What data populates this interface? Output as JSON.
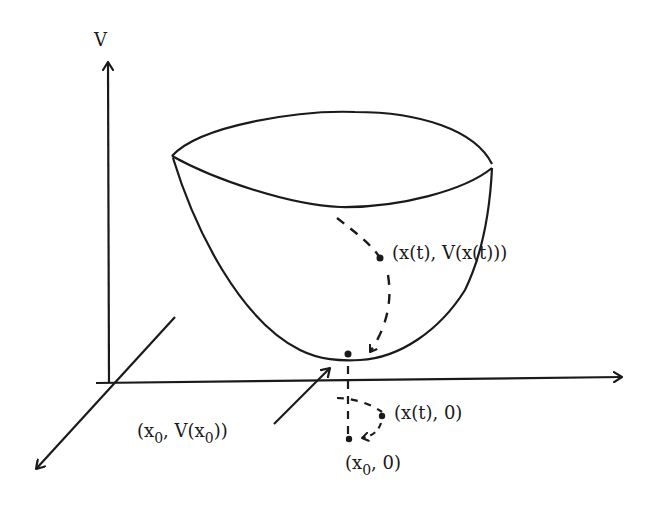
{
  "diagram": {
    "type": "lyapunov-function-bowl",
    "colors": {
      "ink": "#1a1a1a",
      "background": "#ffffff"
    },
    "axes": {
      "vertical_label": "V"
    },
    "labels": {
      "trajectory_on_surface": "(x(t),  V(x(t)))",
      "minimum_point_prefix": "(x",
      "minimum_point_sub1": "0",
      "minimum_point_mid": ", V(x",
      "minimum_point_sub2": "0",
      "minimum_point_suffix": "))",
      "trajectory_in_plane": "(x(t),  0)",
      "equilibrium_prefix": "(x",
      "equilibrium_sub": "0",
      "equilibrium_suffix": ", 0)"
    }
  }
}
